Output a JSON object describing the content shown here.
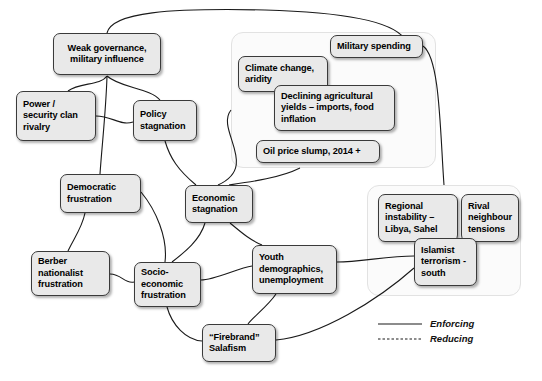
{
  "diagram": {
    "style": {
      "node_fill": "#e9e9e9",
      "node_border": "#3a3a3a",
      "group_fill": "#fbfbfb",
      "group_border": "#e2e2e2",
      "link_color": "#1a1a1a",
      "background": "#ffffff"
    },
    "nodes": [
      {
        "id": "weak-governance",
        "label": "Weak governance,\nmilitary influence",
        "x": 53,
        "y": 33,
        "w": 108,
        "h": 42,
        "align": "center"
      },
      {
        "id": "power-clan-rivalry",
        "label": "Power /\nsecurity clan\nrivalry",
        "x": 16,
        "y": 91,
        "w": 80,
        "h": 50,
        "align": "left"
      },
      {
        "id": "policy-stagnation",
        "label": "Policy\nstagnation",
        "x": 133,
        "y": 100,
        "w": 64,
        "h": 41,
        "align": "left"
      },
      {
        "id": "democratic-frustration",
        "label": "Democratic\nfrustration",
        "x": 60,
        "y": 174,
        "w": 81,
        "h": 39,
        "align": "left"
      },
      {
        "id": "berber-frustration",
        "label": "Berber\nnationalist\nfrustration",
        "x": 31,
        "y": 251,
        "w": 79,
        "h": 45,
        "align": "left"
      },
      {
        "id": "socio-economic",
        "label": "Socio-\neconomic\nfrustration",
        "x": 134,
        "y": 262,
        "w": 67,
        "h": 45,
        "align": "left"
      },
      {
        "id": "economic-stagnation",
        "label": "Economic\nstagnation",
        "x": 185,
        "y": 185,
        "w": 68,
        "h": 38,
        "align": "left"
      },
      {
        "id": "youth-demographics",
        "label": "Youth\ndemographics,\nunemployment",
        "x": 252,
        "y": 245,
        "w": 85,
        "h": 49,
        "align": "left"
      },
      {
        "id": "firebrand-salafism",
        "label": "“Firebrand”\nSalafism",
        "x": 202,
        "y": 324,
        "w": 74,
        "h": 38,
        "align": "left"
      },
      {
        "id": "climate-change",
        "label": "Climate change,\naridity",
        "x": 238,
        "y": 56,
        "w": 90,
        "h": 36,
        "align": "left"
      },
      {
        "id": "military-spending",
        "label": "Military spending",
        "x": 330,
        "y": 35,
        "w": 93,
        "h": 23,
        "align": "left"
      },
      {
        "id": "declining-yields",
        "label": "Declining agricultural\nyields – imports, food\ninflation",
        "x": 274,
        "y": 85,
        "w": 121,
        "h": 46,
        "align": "left"
      },
      {
        "id": "oil-price-slump",
        "label": "Oil price slump, 2014 +",
        "x": 256,
        "y": 140,
        "w": 124,
        "h": 23,
        "align": "left"
      },
      {
        "id": "regional-instability",
        "label": "Regional\ninstability –\nLibya, Sahel",
        "x": 378,
        "y": 194,
        "w": 80,
        "h": 48,
        "align": "left"
      },
      {
        "id": "rival-neighbour",
        "label": "Rival\nneighbour\ntensions",
        "x": 461,
        "y": 194,
        "w": 58,
        "h": 48,
        "align": "left"
      },
      {
        "id": "islamist-terrorism",
        "label": "Islamist\nterrorism -\nsouth",
        "x": 414,
        "y": 238,
        "w": 63,
        "h": 48,
        "align": "left"
      }
    ],
    "groups": [
      {
        "id": "external-economic-group",
        "x": 231,
        "y": 32,
        "w": 205,
        "h": 136
      },
      {
        "id": "regional-security-group",
        "x": 367,
        "y": 185,
        "w": 154,
        "h": 111
      }
    ],
    "links": [
      {
        "id": "weak-governance-to-military-spending",
        "type": "enforcing",
        "d": "M 107 33 C 112 12 170 8 265 10 C 340 12 390 20 404 38"
      },
      {
        "id": "weak-governance-to-power-clan",
        "type": "enforcing",
        "d": "M 107 76 C 100 86 80 82 68 91"
      },
      {
        "id": "weak-governance-to-policy",
        "type": "enforcing",
        "d": "M 107 76 C 120 88 150 88 160 100"
      },
      {
        "id": "weak-governance-to-democratic",
        "type": "enforcing",
        "d": "M 107 76 C 106 110 102 145 100 174"
      },
      {
        "id": "power-clan-to-policy",
        "type": "enforcing",
        "d": "M 96 116 C 112 116 120 126 133 122"
      },
      {
        "id": "policy-to-economic",
        "type": "enforcing",
        "d": "M 165 141 C 170 158 178 170 196 185"
      },
      {
        "id": "group-to-economic",
        "type": "enforcing",
        "d": "M 231 110 C 215 130 260 166 218 185"
      },
      {
        "id": "external-group-bottom-to-economic",
        "type": "enforcing",
        "d": "M 300 168 C 280 178 250 182 229 185"
      },
      {
        "id": "economic-to-socio-economic",
        "type": "enforcing",
        "d": "M 205 223 C 200 240 185 252 172 262"
      },
      {
        "id": "economic-to-youth",
        "type": "enforcing",
        "d": "M 230 223 C 242 233 250 240 262 245"
      },
      {
        "id": "democratic-to-berber",
        "type": "enforcing",
        "d": "M 85 213 C 82 228 74 238 68 251"
      },
      {
        "id": "democratic-to-socio-economic",
        "type": "enforcing",
        "d": "M 141 192 C 156 210 168 238 165 262"
      },
      {
        "id": "berber-to-socio-economic",
        "type": "enforcing",
        "d": "M 110 274 C 122 274 124 284 134 282"
      },
      {
        "id": "socio-economic-to-youth",
        "type": "enforcing",
        "d": "M 201 280 C 215 280 238 268 252 266"
      },
      {
        "id": "socio-economic-to-firebrand",
        "type": "enforcing",
        "d": "M 167 307 C 172 325 186 340 202 341"
      },
      {
        "id": "youth-to-firebrand",
        "type": "enforcing",
        "d": "M 276 294 C 268 306 252 318 248 324"
      },
      {
        "id": "youth-to-islamist",
        "type": "enforcing",
        "d": "M 337 262 C 360 262 388 256 414 256"
      },
      {
        "id": "firebrand-to-islamist",
        "type": "enforcing",
        "d": "M 276 340 C 320 336 378 300 414 268"
      },
      {
        "id": "military-spending-to-regional-group",
        "type": "enforcing",
        "d": "M 423 46 C 440 58 440 130 444 185"
      }
    ],
    "legend": {
      "items": [
        {
          "id": "legend-enforcing",
          "label": "Enforcing",
          "style": "solid"
        },
        {
          "id": "legend-reducing",
          "label": "Reducing",
          "style": "dashed"
        }
      ],
      "x": 378,
      "y": 324
    }
  }
}
